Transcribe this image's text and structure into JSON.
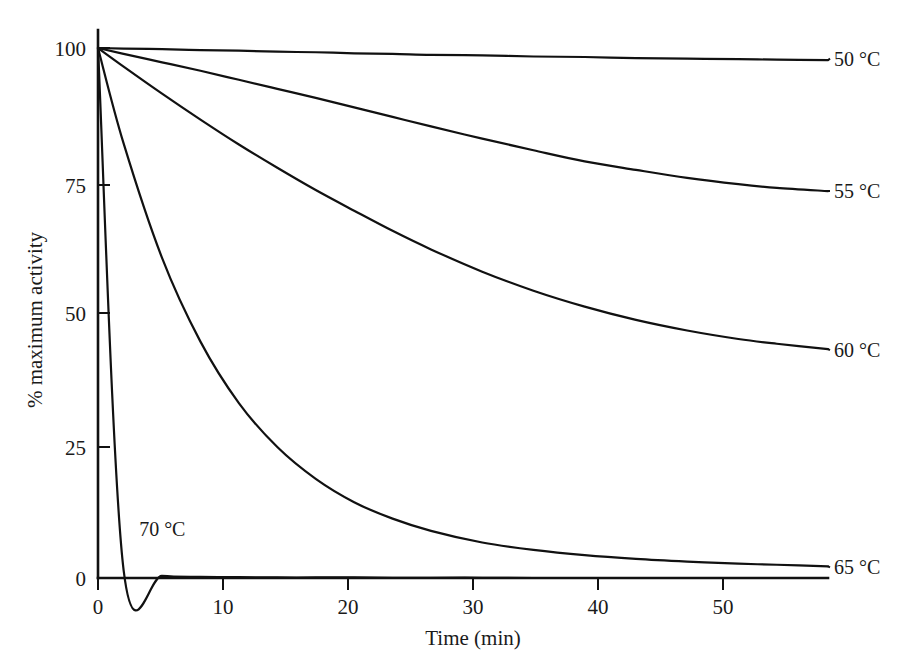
{
  "chart_data": {
    "type": "line",
    "title": "",
    "subtitle": "",
    "xlabel": "Time (min)",
    "ylabel": "% maximum activity",
    "xlim": [
      0,
      57
    ],
    "ylim": [
      0,
      103
    ],
    "xticks": [
      0,
      10,
      20,
      30,
      40,
      50
    ],
    "yticks": [
      0,
      25,
      50,
      75,
      100
    ],
    "xtick_labels": [
      "0",
      "10",
      "20",
      "30",
      "40",
      "50"
    ],
    "ytick_labels": [
      "0",
      "25",
      "50",
      "75",
      "100"
    ],
    "grid": false,
    "legend_position": "right-of-curve-ends",
    "line_color": "#111111",
    "background_color": "#ffffff",
    "x": [
      0,
      2,
      5,
      8,
      11,
      14,
      17,
      20,
      23,
      26,
      30,
      34,
      38,
      42,
      46,
      50,
      53,
      57
    ],
    "series": [
      {
        "name": "50 °C",
        "label": "50 °C",
        "label_x": 57,
        "label_y": 98,
        "values": [
          100,
          99.9,
          99.8,
          99.6,
          99.5,
          99.3,
          99.2,
          99.0,
          98.9,
          98.7,
          98.6,
          98.4,
          98.3,
          98.1,
          98.0,
          97.9,
          97.8,
          97.7
        ]
      },
      {
        "name": "55 °C",
        "label": "55 °C",
        "label_x": 57,
        "label_y": 73,
        "values": [
          100,
          98.9,
          97.3,
          95.7,
          94.0,
          92.3,
          90.6,
          88.8,
          87.0,
          85.2,
          82.9,
          80.7,
          78.6,
          77.0,
          75.5,
          74.3,
          73.6,
          73.0
        ]
      },
      {
        "name": "60 °C",
        "label": "60 °C",
        "label_x": 57,
        "label_y": 43,
        "values": [
          100,
          96.5,
          91.4,
          86.5,
          81.8,
          77.4,
          73.2,
          69.3,
          65.5,
          62.0,
          57.8,
          54.2,
          51.2,
          48.7,
          46.7,
          45.1,
          44.2,
          43.2
        ]
      },
      {
        "name": "65 °C",
        "label": "65 °C",
        "label_x": 57,
        "label_y": 2,
        "values": [
          100,
          82.0,
          60.4,
          44.6,
          33.0,
          24.7,
          18.7,
          14.3,
          11.2,
          8.9,
          6.7,
          5.3,
          4.3,
          3.6,
          3.1,
          2.7,
          2.5,
          2.2
        ]
      },
      {
        "name": "70 °C",
        "label": "70 °C",
        "label_x": 2.9,
        "label_y": 9.5,
        "values": [
          100,
          1.5,
          0.4,
          0.2,
          0.15,
          0.1,
          0.1,
          0.1,
          0.05,
          0.05,
          0.05,
          0.0,
          0.0,
          0.0,
          0.0,
          0.0,
          0.0,
          0.0
        ]
      }
    ]
  },
  "axes": {
    "y_title": "% maximum activity",
    "x_title": "Time (min)"
  },
  "labels": {
    "t50": "50 °C",
    "t55": "55 °C",
    "t60": "60 °C",
    "t65": "65 °C",
    "t70": "70 °C"
  },
  "ticks": {
    "y": [
      "100",
      "75",
      "50",
      "25",
      "0"
    ],
    "x": [
      "0",
      "10",
      "20",
      "30",
      "40",
      "50"
    ]
  }
}
